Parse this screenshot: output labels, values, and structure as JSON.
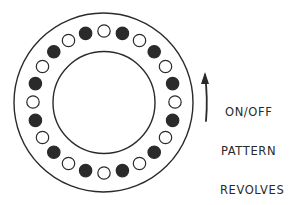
{
  "diagram": {
    "stroke_color": "#2a2a2a",
    "fill_on": "#2a2a2a",
    "fill_off": "#ffffff",
    "outer_ring": {
      "cx": 103.5,
      "cy": 102.5,
      "r": 89.5
    },
    "inner_ring": {
      "cx": 104,
      "cy": 102.5,
      "r": 51
    },
    "dots": {
      "count": 24,
      "ring_radius": 71,
      "dot_radius": 6.2,
      "start_angle_deg": -105,
      "pattern": [
        "on",
        "off",
        "on",
        "off",
        "on",
        "off",
        "on",
        "off",
        "on",
        "off",
        "on",
        "off",
        "on",
        "off",
        "on",
        "off",
        "on",
        "off",
        "on",
        "off",
        "on",
        "off",
        "on",
        "off"
      ]
    },
    "arrow": {
      "direction": "up",
      "meaning": "rotation direction",
      "path": "M206,121 Q208,98 205,75"
    },
    "label_lines": [
      "ON/OFF",
      "PATTERN",
      "REVOLVES"
    ]
  }
}
